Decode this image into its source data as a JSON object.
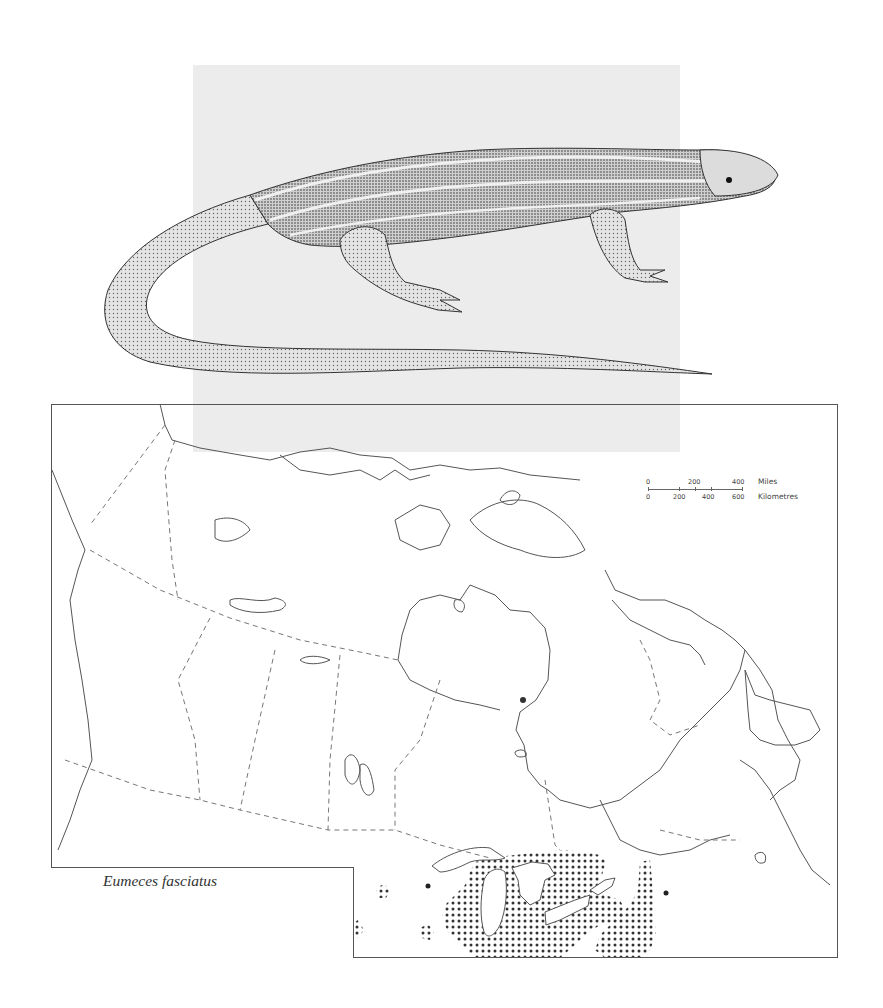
{
  "figure": {
    "species_label": "Eumeces fasciatus",
    "illustration": "five-lined-skink-stipple-drawing",
    "map_region": "Canada and northern United States",
    "range_pattern": "stippled-dots",
    "colors": {
      "background": "#ffffff",
      "panel_gray": "#ececec",
      "line": "#555555",
      "stipple": "#333333"
    }
  },
  "scale_bar": {
    "miles": {
      "ticks": [
        "0",
        "200",
        "400"
      ],
      "unit_label": "Miles"
    },
    "kilometres": {
      "ticks": [
        "0",
        "200",
        "400",
        "600"
      ],
      "unit_label": "Kilometres"
    }
  },
  "legend": {
    "isolated_records": "filled-dot-markers",
    "count_visible": 2
  }
}
